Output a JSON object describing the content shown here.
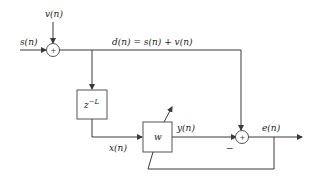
{
  "diagram": {
    "signals": {
      "input": "s(n)",
      "noise": "v(n)",
      "desired": "d(n) = s(n) + v(n)",
      "delayed": "x(n)",
      "output": "y(n)",
      "error": "e(n)"
    },
    "blocks": {
      "delay": {
        "label_base": "z",
        "label_exp": "−L"
      },
      "filter": {
        "label": "w"
      }
    },
    "junctions": {
      "top_sum": "+",
      "bottom_sum": "+",
      "minus_sign": "−"
    },
    "colors": {
      "line": "#3a3a3a",
      "text": "#222222",
      "background": "#ffffff"
    }
  }
}
